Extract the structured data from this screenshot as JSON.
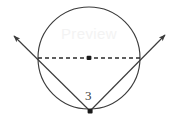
{
  "figure": {
    "kind": "geometry-diagram",
    "background_color": "#ffffff",
    "stroke_color": "#3b3b3b",
    "dash_color": "#2b2b2b",
    "label_color": "#3b3b3b",
    "watermark_text": "Preview",
    "labels": {
      "angle": "3"
    },
    "circle": {
      "center_x": 89,
      "center_y": 58,
      "radius": 51
    },
    "diameter": {
      "left_x": 38,
      "right_x": 140,
      "y": 58,
      "style": "dashed"
    },
    "center_point": {
      "x": 89,
      "y": 58
    },
    "vertex_point": {
      "x": 90,
      "y": 111
    },
    "rays": [
      {
        "name": "left-ray",
        "from_x": 90,
        "from_y": 111,
        "through_x": 38,
        "through_y": 58,
        "arrow_x": 11,
        "arrow_y": 33
      },
      {
        "name": "right-ray",
        "from_x": 90,
        "from_y": 111,
        "through_x": 140,
        "through_y": 58,
        "arrow_x": 168,
        "arrow_y": 32
      }
    ]
  }
}
